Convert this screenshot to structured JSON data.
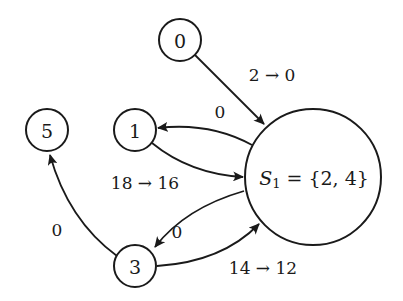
{
  "diagram": {
    "type": "directed-graph",
    "nodes": [
      {
        "id": "0",
        "label": "0",
        "cx": 180,
        "cy": 40,
        "r": 21
      },
      {
        "id": "5",
        "label": "5",
        "cx": 47,
        "cy": 130,
        "r": 21
      },
      {
        "id": "1",
        "label": "1",
        "cx": 135,
        "cy": 130,
        "r": 21
      },
      {
        "id": "3",
        "label": "3",
        "cx": 135,
        "cy": 266,
        "r": 21
      },
      {
        "id": "S1",
        "label_var": "S",
        "label_sub": "1",
        "label_rest": " = {2, 4}",
        "cx": 313,
        "cy": 177,
        "r": 68
      }
    ],
    "edges": [
      {
        "from": "0",
        "to": "S1",
        "label": "2 → 0"
      },
      {
        "from": "S1",
        "to": "1",
        "label": "0"
      },
      {
        "from": "1",
        "to": "S1",
        "label": "18 → 16"
      },
      {
        "from": "S1",
        "to": "3",
        "label": "0"
      },
      {
        "from": "3",
        "to": "5",
        "label": "0"
      },
      {
        "from": "3",
        "to": "S1",
        "label": "14 → 12"
      }
    ]
  },
  "colors": {
    "stroke": "#1a1a1a",
    "background": "#ffffff"
  }
}
